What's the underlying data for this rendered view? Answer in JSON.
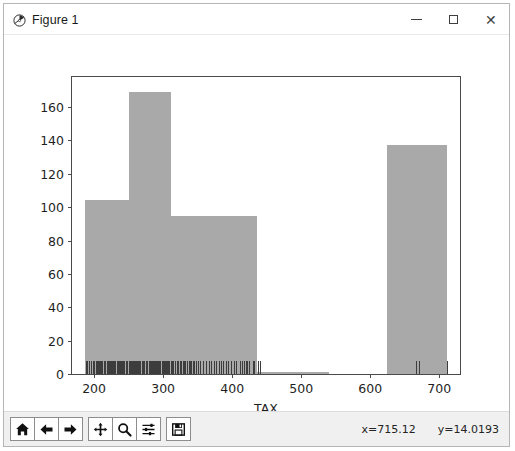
{
  "window": {
    "title": "Figure 1",
    "icon": "matplotlib-icon",
    "controls": {
      "minimize": "–",
      "maximize": "□",
      "close": "✕"
    }
  },
  "toolbar": {
    "buttons": [
      {
        "name": "home-icon",
        "tooltip": "Reset original view"
      },
      {
        "name": "back-arrow-icon",
        "tooltip": "Back to previous view"
      },
      {
        "name": "forward-arrow-icon",
        "tooltip": "Forward to next view"
      },
      {
        "name": "pan-icon",
        "tooltip": "Pan axes with left mouse, zoom with right"
      },
      {
        "name": "zoom-magnifier-icon",
        "tooltip": "Zoom to rectangle"
      },
      {
        "name": "subplot-config-icon",
        "tooltip": "Configure subplots"
      },
      {
        "name": "save-floppy-icon",
        "tooltip": "Save the figure"
      }
    ],
    "status": {
      "x": "x=715.12",
      "y": "y=14.0193"
    }
  },
  "chart_data": {
    "type": "bar",
    "title": "",
    "xlabel": "TAX",
    "ylabel": "",
    "xlim": [
      168,
      730
    ],
    "ylim": [
      0,
      178
    ],
    "grid": false,
    "legend": null,
    "bar_color": "#a9a9a9",
    "xticks": [
      200,
      300,
      400,
      500,
      600,
      700
    ],
    "yticks": [
      0,
      20,
      40,
      60,
      80,
      100,
      120,
      140,
      160
    ],
    "bins": [
      {
        "start": 187,
        "end": 250,
        "value": 104
      },
      {
        "start": 250,
        "end": 311,
        "value": 169
      },
      {
        "start": 311,
        "end": 436,
        "value": 95
      },
      {
        "start": 436,
        "end": 540,
        "value": 1
      },
      {
        "start": 624,
        "end": 711,
        "value": 137
      }
    ],
    "rug": {
      "label": "rug-marks",
      "values": [
        188,
        190,
        192,
        193,
        196,
        198,
        200,
        203,
        204,
        206,
        207,
        209,
        210,
        212,
        214,
        216,
        218,
        220,
        222,
        223,
        224,
        226,
        228,
        229,
        231,
        233,
        234,
        236,
        237,
        239,
        241,
        242,
        243,
        244,
        246,
        247,
        248,
        250,
        252,
        254,
        255,
        256,
        258,
        259,
        260,
        262,
        263,
        264,
        265,
        266,
        267,
        269,
        270,
        271,
        272,
        273,
        275,
        276,
        277,
        279,
        280,
        281,
        283,
        284,
        285,
        287,
        288,
        289,
        291,
        293,
        294,
        296,
        298,
        300,
        301,
        303,
        304,
        305,
        307,
        309,
        311,
        313,
        315,
        317,
        320,
        322,
        324,
        326,
        329,
        330,
        332,
        334,
        337,
        339,
        340,
        343,
        345,
        348,
        351,
        354,
        358,
        362,
        366,
        370,
        374,
        377,
        381,
        384,
        387,
        391,
        394,
        398,
        402,
        403,
        406,
        411,
        414,
        417,
        420,
        422,
        425,
        430,
        432,
        437,
        440,
        666,
        671,
        711
      ]
    }
  }
}
